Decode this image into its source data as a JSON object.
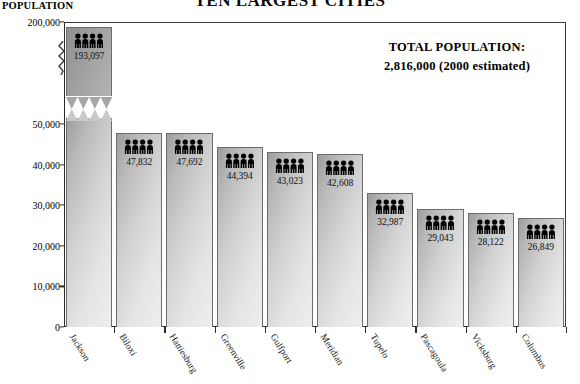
{
  "chart_title": "TEN LARGEST CITIES",
  "axis_title": "POPULATION",
  "annotation": {
    "heading": "TOTAL POPULATION:",
    "value": "2,816,000  (2000 estimated)"
  },
  "icon_names": {
    "people": "people-group-icon",
    "axis_break": "axis-break-zigzag-icon"
  },
  "chart_data": {
    "type": "bar",
    "title": "TEN LARGEST CITIES",
    "subtitle": "",
    "xlabel": "",
    "ylabel": "POPULATION",
    "grid": false,
    "legend": "none",
    "axis_break": {
      "present": true,
      "break_low": 50000,
      "break_high": 200000,
      "note": "y-axis compressed between 50,000 and 200,000"
    },
    "ylim": [
      0,
      200000
    ],
    "yticks": [
      0,
      10000,
      20000,
      30000,
      40000,
      50000,
      200000
    ],
    "ytick_labels": [
      "0",
      "10,000",
      "20,000",
      "30,000",
      "40,000",
      "50,000",
      "200,000"
    ],
    "categories": [
      "Jackson",
      "Biloxi",
      "Hattiesburg",
      "Greenville",
      "Gulfport",
      "Meridian",
      "Tupelo",
      "Pascagoula",
      "Vicksburg",
      "Columbus"
    ],
    "values": [
      193097,
      47832,
      47692,
      44394,
      43023,
      42608,
      32987,
      29043,
      28122,
      26849
    ],
    "value_labels": [
      "193,097",
      "47,832",
      "47,692",
      "44,394",
      "43,023",
      "42,608",
      "32,987",
      "29,043",
      "28,122",
      "26,849"
    ],
    "total_population": "2,816,000",
    "total_population_note": "(2000 estimated)"
  }
}
